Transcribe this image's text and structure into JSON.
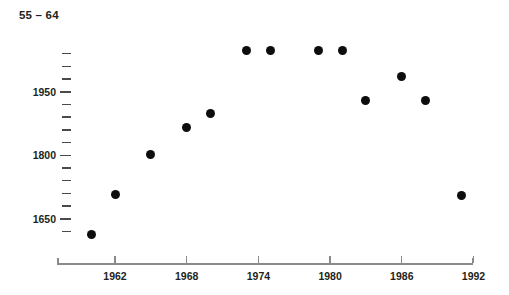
{
  "chart_data": {
    "type": "scatter",
    "title": "55 – 64",
    "xlabel": "",
    "ylabel": "",
    "xlim": [
      1959,
      1993
    ],
    "ylim": [
      1590,
      2070
    ],
    "grid": false,
    "legend": null,
    "x_ticks": [
      1962,
      1968,
      1974,
      1980,
      1986,
      1992
    ],
    "x_tick_labels": [
      "1962",
      "1968",
      "1974",
      "1980",
      "1986",
      "1992"
    ],
    "y_ticks": [
      1650,
      1800,
      1950
    ],
    "y_tick_labels": [
      "1650",
      "1800",
      "1950"
    ],
    "y_minor_tick_step": 30,
    "y_minor_ticks": [
      1620,
      1680,
      1710,
      1740,
      1770,
      1830,
      1860,
      1890,
      1920,
      1980,
      2010,
      2040
    ],
    "marker": "filled-circle",
    "marker_color": "#0d0d0d",
    "axis_color": "#8a8a8a",
    "x": [
      1960,
      1962,
      1965,
      1968,
      1970,
      1973,
      1975,
      1979,
      1981,
      1983,
      1986,
      1988,
      1991
    ],
    "y": [
      1612,
      1707,
      1803,
      1865,
      1898,
      2048,
      2048,
      2048,
      2048,
      1929,
      1985,
      1929,
      1706
    ],
    "points": [
      {
        "year": 1960,
        "value": 1612
      },
      {
        "year": 1962,
        "value": 1707
      },
      {
        "year": 1965,
        "value": 1803
      },
      {
        "year": 1968,
        "value": 1865
      },
      {
        "year": 1970,
        "value": 1898
      },
      {
        "year": 1973,
        "value": 2048
      },
      {
        "year": 1975,
        "value": 2048
      },
      {
        "year": 1979,
        "value": 2048
      },
      {
        "year": 1981,
        "value": 2048
      },
      {
        "year": 1983,
        "value": 1929
      },
      {
        "year": 1986,
        "value": 1985
      },
      {
        "year": 1988,
        "value": 1929
      },
      {
        "year": 1991,
        "value": 1706
      }
    ]
  }
}
